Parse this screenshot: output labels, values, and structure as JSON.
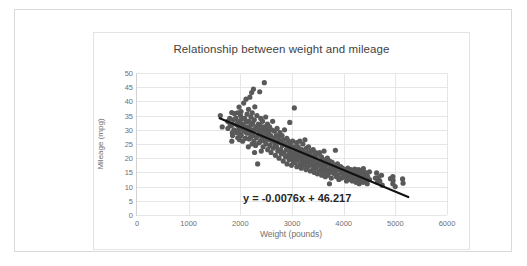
{
  "chart_data": {
    "type": "scatter",
    "title": "Relationship between weight and mileage",
    "xlabel": "Weight (pounds)",
    "ylabel": "Mileage (mpg)",
    "xlim": [
      0,
      6000
    ],
    "ylim": [
      0,
      50
    ],
    "xticks": [
      0,
      1000,
      2000,
      3000,
      4000,
      5000,
      6000
    ],
    "yticks": [
      0,
      5,
      10,
      15,
      20,
      25,
      30,
      35,
      40,
      45,
      50
    ],
    "grid": true,
    "legend": "none",
    "marker_color": "#595959",
    "trendline_color": "#111111",
    "annotations": [
      {
        "text": "y = -0.0076x + 46.217",
        "x": 3100,
        "y": 5.5
      }
    ],
    "trendline": {
      "slope": -0.0076,
      "intercept": 46.217,
      "x_start": 1600,
      "x_end": 5250
    },
    "points": [
      [
        1613,
        35.0
      ],
      [
        1649,
        31.0
      ],
      [
        1755,
        33.0
      ],
      [
        1760,
        30.5
      ],
      [
        1795,
        34.0
      ],
      [
        1800,
        32.0
      ],
      [
        1825,
        31.5
      ],
      [
        1834,
        36.1
      ],
      [
        1835,
        26.0
      ],
      [
        1836,
        32.0
      ],
      [
        1845,
        29.0
      ],
      [
        1850,
        28.0
      ],
      [
        1867,
        33.5
      ],
      [
        1875,
        30.0
      ],
      [
        1883,
        35.7
      ],
      [
        1915,
        34.1
      ],
      [
        1925,
        31.9
      ],
      [
        1937,
        29.0
      ],
      [
        1945,
        36.0
      ],
      [
        1950,
        27.2
      ],
      [
        1955,
        32.8
      ],
      [
        1965,
        29.8
      ],
      [
        1968,
        31.0
      ],
      [
        1975,
        38.0
      ],
      [
        1980,
        30.0
      ],
      [
        1985,
        26.5
      ],
      [
        1990,
        33.0
      ],
      [
        1995,
        28.4
      ],
      [
        2000,
        32.2
      ],
      [
        2005,
        35.0
      ],
      [
        2010,
        31.0
      ],
      [
        2014,
        36.4
      ],
      [
        2019,
        28.0
      ],
      [
        2020,
        30.9
      ],
      [
        2025,
        33.8
      ],
      [
        2045,
        26.0
      ],
      [
        2050,
        32.0
      ],
      [
        2065,
        39.4
      ],
      [
        2070,
        29.5
      ],
      [
        2075,
        31.2
      ],
      [
        2085,
        34.0
      ],
      [
        2100,
        27.0
      ],
      [
        2108,
        30.0
      ],
      [
        2110,
        40.8
      ],
      [
        2120,
        32.9
      ],
      [
        2125,
        28.8
      ],
      [
        2130,
        35.5
      ],
      [
        2145,
        31.0
      ],
      [
        2155,
        24.0
      ],
      [
        2158,
        37.2
      ],
      [
        2164,
        29.0
      ],
      [
        2170,
        33.0
      ],
      [
        2171,
        26.8
      ],
      [
        2184,
        41.5
      ],
      [
        2190,
        30.2
      ],
      [
        2200,
        27.5
      ],
      [
        2205,
        34.5
      ],
      [
        2210,
        31.8
      ],
      [
        2219,
        43.1
      ],
      [
        2220,
        29.0
      ],
      [
        2228,
        25.0
      ],
      [
        2230,
        36.0
      ],
      [
        2240,
        32.4
      ],
      [
        2245,
        28.0
      ],
      [
        2254,
        44.3
      ],
      [
        2260,
        30.0
      ],
      [
        2265,
        26.0
      ],
      [
        2270,
        33.5
      ],
      [
        2275,
        22.0
      ],
      [
        2280,
        38.1
      ],
      [
        2288,
        29.9
      ],
      [
        2295,
        24.5
      ],
      [
        2300,
        31.0
      ],
      [
        2310,
        27.2
      ],
      [
        2320,
        35.0
      ],
      [
        2330,
        30.5
      ],
      [
        2335,
        18.0
      ],
      [
        2340,
        28.0
      ],
      [
        2350,
        32.0
      ],
      [
        2360,
        25.4
      ],
      [
        2370,
        29.0
      ],
      [
        2375,
        43.4
      ],
      [
        2385,
        31.5
      ],
      [
        2390,
        26.0
      ],
      [
        2395,
        34.0
      ],
      [
        2400,
        28.5
      ],
      [
        2405,
        22.5
      ],
      [
        2410,
        30.0
      ],
      [
        2420,
        27.0
      ],
      [
        2430,
        33.0
      ],
      [
        2440,
        24.0
      ],
      [
        2450,
        29.5
      ],
      [
        2464,
        46.6
      ],
      [
        2465,
        31.0
      ],
      [
        2472,
        26.0
      ],
      [
        2480,
        28.0
      ],
      [
        2490,
        34.5
      ],
      [
        2500,
        25.0
      ],
      [
        2506,
        30.0
      ],
      [
        2515,
        27.5
      ],
      [
        2525,
        32.0
      ],
      [
        2530,
        23.0
      ],
      [
        2545,
        29.0
      ],
      [
        2556,
        26.5
      ],
      [
        2565,
        31.0
      ],
      [
        2575,
        24.5
      ],
      [
        2587,
        28.0
      ],
      [
        2595,
        22.0
      ],
      [
        2605,
        30.0
      ],
      [
        2615,
        26.0
      ],
      [
        2625,
        33.0
      ],
      [
        2634,
        23.5
      ],
      [
        2645,
        27.0
      ],
      [
        2660,
        29.5
      ],
      [
        2672,
        25.0
      ],
      [
        2678,
        21.0
      ],
      [
        2694,
        28.0
      ],
      [
        2702,
        24.0
      ],
      [
        2711,
        30.5
      ],
      [
        2720,
        26.0
      ],
      [
        2725,
        22.5
      ],
      [
        2740,
        27.5
      ],
      [
        2750,
        20.0
      ],
      [
        2755,
        25.5
      ],
      [
        2765,
        29.0
      ],
      [
        2780,
        23.0
      ],
      [
        2789,
        26.0
      ],
      [
        2795,
        21.5
      ],
      [
        2807,
        28.0
      ],
      [
        2815,
        24.5
      ],
      [
        2830,
        19.0
      ],
      [
        2835,
        26.5
      ],
      [
        2845,
        22.0
      ],
      [
        2855,
        30.0
      ],
      [
        2865,
        25.0
      ],
      [
        2875,
        20.5
      ],
      [
        2890,
        23.0
      ],
      [
        2900,
        27.0
      ],
      [
        2904,
        18.0
      ],
      [
        2915,
        24.0
      ],
      [
        2925,
        21.0
      ],
      [
        2933,
        26.0
      ],
      [
        2945,
        19.5
      ],
      [
        2950,
        22.5
      ],
      [
        2957,
        32.6
      ],
      [
        2965,
        25.0
      ],
      [
        2975,
        20.0
      ],
      [
        2984,
        23.5
      ],
      [
        2990,
        17.5
      ],
      [
        3000,
        21.5
      ],
      [
        3012,
        26.0
      ],
      [
        3021,
        19.0
      ],
      [
        3035,
        24.0
      ],
      [
        3039,
        22.0
      ],
      [
        3045,
        37.7
      ],
      [
        3055,
        20.5
      ],
      [
        3060,
        18.5
      ],
      [
        3070,
        23.0
      ],
      [
        3085,
        21.0
      ],
      [
        3090,
        25.5
      ],
      [
        3095,
        17.0
      ],
      [
        3102,
        22.0
      ],
      [
        3110,
        19.5
      ],
      [
        3121,
        24.0
      ],
      [
        3139,
        20.0
      ],
      [
        3150,
        26.0
      ],
      [
        3155,
        18.0
      ],
      [
        3160,
        22.5
      ],
      [
        3169,
        21.0
      ],
      [
        3180,
        16.5
      ],
      [
        3190,
        23.0
      ],
      [
        3205,
        19.0
      ],
      [
        3211,
        25.0
      ],
      [
        3221,
        20.5
      ],
      [
        3230,
        17.5
      ],
      [
        3233,
        22.0
      ],
      [
        3245,
        18.5
      ],
      [
        3250,
        26.5
      ],
      [
        3265,
        21.0
      ],
      [
        3270,
        16.0
      ],
      [
        3278,
        23.5
      ],
      [
        3288,
        19.5
      ],
      [
        3295,
        22.0
      ],
      [
        3302,
        17.0
      ],
      [
        3310,
        20.0
      ],
      [
        3320,
        24.0
      ],
      [
        3329,
        18.0
      ],
      [
        3336,
        21.5
      ],
      [
        3353,
        15.5
      ],
      [
        3360,
        19.0
      ],
      [
        3365,
        22.5
      ],
      [
        3380,
        17.5
      ],
      [
        3395,
        20.5
      ],
      [
        3405,
        16.0
      ],
      [
        3410,
        23.0
      ],
      [
        3420,
        18.5
      ],
      [
        3425,
        21.0
      ],
      [
        3433,
        15.0
      ],
      [
        3439,
        19.5
      ],
      [
        3445,
        17.0
      ],
      [
        3459,
        22.0
      ],
      [
        3465,
        16.5
      ],
      [
        3470,
        20.0
      ],
      [
        3480,
        18.0
      ],
      [
        3490,
        14.5
      ],
      [
        3504,
        21.5
      ],
      [
        3520,
        17.5
      ],
      [
        3525,
        19.0
      ],
      [
        3530,
        15.5
      ],
      [
        3535,
        22.0
      ],
      [
        3545,
        18.0
      ],
      [
        3563,
        16.0
      ],
      [
        3570,
        20.5
      ],
      [
        3574,
        14.0
      ],
      [
        3585,
        17.0
      ],
      [
        3605,
        19.5
      ],
      [
        3609,
        15.0
      ],
      [
        3613,
        18.0
      ],
      [
        3620,
        22.5
      ],
      [
        3630,
        16.5
      ],
      [
        3645,
        13.5
      ],
      [
        3651,
        19.0
      ],
      [
        3664,
        17.5
      ],
      [
        3672,
        15.5
      ],
      [
        3685,
        20.0
      ],
      [
        3693,
        14.0
      ],
      [
        3700,
        18.0
      ],
      [
        3715,
        16.0
      ],
      [
        3725,
        11.0
      ],
      [
        3730,
        19.0
      ],
      [
        3735,
        15.0
      ],
      [
        3755,
        17.0
      ],
      [
        3761,
        13.0
      ],
      [
        3777,
        18.5
      ],
      [
        3785,
        16.0
      ],
      [
        3820,
        14.5
      ],
      [
        3830,
        17.5
      ],
      [
        3840,
        22.8
      ],
      [
        3850,
        15.5
      ],
      [
        3860,
        13.5
      ],
      [
        3870,
        16.5
      ],
      [
        3880,
        18.0
      ],
      [
        3892,
        14.0
      ],
      [
        3900,
        16.0
      ],
      [
        3907,
        12.5
      ],
      [
        3940,
        17.0
      ],
      [
        3955,
        15.0
      ],
      [
        3962,
        13.0
      ],
      [
        3975,
        16.5
      ],
      [
        3988,
        14.5
      ],
      [
        4000,
        15.5
      ],
      [
        4020,
        13.5
      ],
      [
        4034,
        16.0
      ],
      [
        4042,
        14.0
      ],
      [
        4054,
        12.0
      ],
      [
        4060,
        15.0
      ],
      [
        4077,
        13.0
      ],
      [
        4080,
        16.5
      ],
      [
        4096,
        14.5
      ],
      [
        4100,
        12.5
      ],
      [
        4129,
        15.5
      ],
      [
        4135,
        13.5
      ],
      [
        4141,
        16.0
      ],
      [
        4154,
        14.0
      ],
      [
        4165,
        12.0
      ],
      [
        4190,
        15.0
      ],
      [
        4209,
        13.0
      ],
      [
        4215,
        16.2
      ],
      [
        4220,
        14.2
      ],
      [
        4237,
        11.5
      ],
      [
        4250,
        15.2
      ],
      [
        4257,
        13.2
      ],
      [
        4274,
        14.8
      ],
      [
        4278,
        12.2
      ],
      [
        4288,
        16.0
      ],
      [
        4294,
        13.8
      ],
      [
        4300,
        11.0
      ],
      [
        4312,
        15.0
      ],
      [
        4325,
        13.0
      ],
      [
        4335,
        14.5
      ],
      [
        4341,
        12.0
      ],
      [
        4354,
        15.5
      ],
      [
        4363,
        13.5
      ],
      [
        4376,
        11.5
      ],
      [
        4380,
        14.0
      ],
      [
        4382,
        16.3
      ],
      [
        4385,
        12.5
      ],
      [
        4390,
        13.8
      ],
      [
        4410,
        15.0
      ],
      [
        4422,
        12.0
      ],
      [
        4440,
        14.0
      ],
      [
        4456,
        11.0
      ],
      [
        4464,
        13.5
      ],
      [
        4499,
        15.2
      ],
      [
        4502,
        12.5
      ],
      [
        4615,
        13.0
      ],
      [
        4638,
        14.8
      ],
      [
        4654,
        11.5
      ],
      [
        4668,
        13.2
      ],
      [
        4699,
        12.0
      ],
      [
        4732,
        14.0
      ],
      [
        4746,
        10.5
      ],
      [
        4906,
        12.8
      ],
      [
        4951,
        11.0
      ],
      [
        4952,
        13.5
      ],
      [
        4955,
        12.2
      ],
      [
        4997,
        10.0
      ],
      [
        5140,
        12.7
      ],
      [
        5150,
        11.2
      ]
    ]
  }
}
